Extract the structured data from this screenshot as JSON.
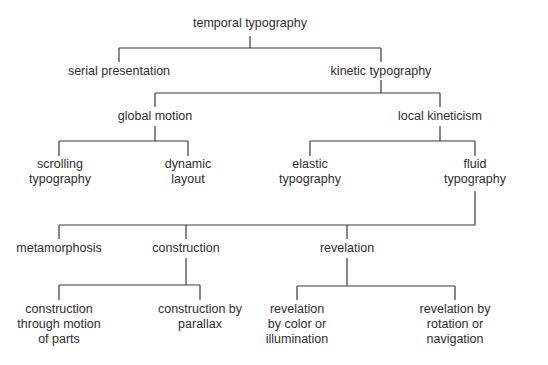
{
  "diagram": {
    "type": "tree",
    "nodes": {
      "root": {
        "label": "temporal typography"
      },
      "serial": {
        "label": "serial presentation"
      },
      "kinetic": {
        "label": "kinetic typography"
      },
      "global": {
        "label": "global motion"
      },
      "local": {
        "label": "local kineticism"
      },
      "scrolling": {
        "lines": [
          "scrolling",
          "typography"
        ]
      },
      "dynamic": {
        "lines": [
          "dynamic",
          "layout"
        ]
      },
      "elastic": {
        "lines": [
          "elastic",
          "typography"
        ]
      },
      "fluid": {
        "lines": [
          "fluid",
          "typography"
        ]
      },
      "metamorphosis": {
        "label": "metamorphosis"
      },
      "construction": {
        "label": "construction"
      },
      "revelation": {
        "label": "revelation"
      },
      "construction_motion": {
        "lines": [
          "construction",
          "through motion",
          "of parts"
        ]
      },
      "construction_parallax": {
        "lines": [
          "construction by",
          "parallax"
        ]
      },
      "revelation_color": {
        "lines": [
          "revelation",
          "by color or",
          "illumination"
        ]
      },
      "revelation_rotation": {
        "lines": [
          "revelation by",
          "rotation or",
          "navigation"
        ]
      }
    },
    "edges": [
      [
        "temporal typography",
        "serial presentation"
      ],
      [
        "temporal typography",
        "kinetic typography"
      ],
      [
        "kinetic typography",
        "global motion"
      ],
      [
        "kinetic typography",
        "local kineticism"
      ],
      [
        "global motion",
        "scrolling typography"
      ],
      [
        "global motion",
        "dynamic layout"
      ],
      [
        "local kineticism",
        "elastic typography"
      ],
      [
        "local kineticism",
        "fluid typography"
      ],
      [
        "fluid typography",
        "metamorphosis"
      ],
      [
        "fluid typography",
        "construction"
      ],
      [
        "fluid typography",
        "revelation"
      ],
      [
        "construction",
        "construction through motion of parts"
      ],
      [
        "construction",
        "construction by parallax"
      ],
      [
        "revelation",
        "revelation by color or illumination"
      ],
      [
        "revelation",
        "revelation by rotation or navigation"
      ]
    ]
  }
}
